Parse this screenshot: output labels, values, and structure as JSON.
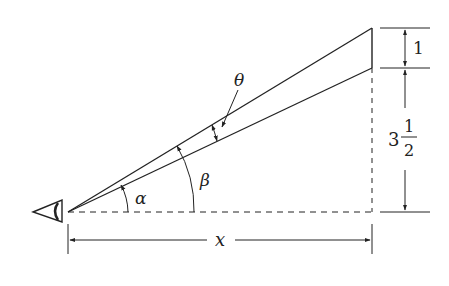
{
  "diagram": {
    "labels": {
      "theta": "θ",
      "alpha": "α",
      "beta": "β",
      "x": "x",
      "upper_height": "1",
      "lower_height_whole": "3",
      "lower_height_num": "1",
      "lower_height_den": "2"
    },
    "colors": {
      "stroke": "#222222",
      "background": "#ffffff"
    }
  }
}
